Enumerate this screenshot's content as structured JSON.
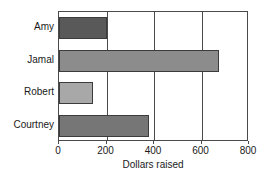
{
  "chart_data": {
    "type": "bar",
    "orientation": "horizontal",
    "title": "",
    "xlabel": "Dollars raised",
    "ylabel": "",
    "xlim": [
      0,
      800
    ],
    "xticks": [
      0,
      200,
      400,
      600,
      800
    ],
    "grid": "vertical-gridlines-at-200-400-600",
    "legend": "none",
    "categories": [
      "Amy",
      "Jamal",
      "Robert",
      "Courtney"
    ],
    "values": [
      200,
      675,
      145,
      380
    ],
    "bar_colors": [
      "#595959",
      "#8c8c8c",
      "#a8a8a8",
      "#767676"
    ],
    "bar_border_color": "#3c3c3c",
    "axis_color": "#4a4a4a",
    "background_color": "#ffffff",
    "bars": [
      {
        "label": "Amy",
        "value": 200,
        "color": "#595959"
      },
      {
        "label": "Jamal",
        "value": 675,
        "color": "#8c8c8c"
      },
      {
        "label": "Robert",
        "value": 145,
        "color": "#a8a8a8"
      },
      {
        "label": "Courtney",
        "value": 380,
        "color": "#767676"
      }
    ]
  }
}
